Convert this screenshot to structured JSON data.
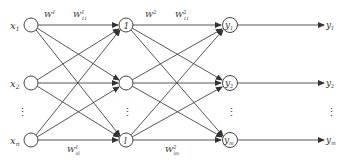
{
  "diagram": {
    "type": "feedforward-neural-network",
    "layers": {
      "input": {
        "nodes": [
          {
            "id": "x1",
            "label": "x",
            "sub": "1"
          },
          {
            "id": "x2",
            "label": "x",
            "sub": "2"
          },
          {
            "id": "xn",
            "label": "x",
            "sub": "n"
          }
        ],
        "ellipsis": "⋮"
      },
      "hidden": {
        "nodes": [
          {
            "id": "h1",
            "label": "1"
          },
          {
            "id": "h2",
            "label": ""
          },
          {
            "id": "hl",
            "label": "l"
          }
        ],
        "ellipsis": "⋮"
      },
      "output": {
        "nodes": [
          {
            "id": "y1",
            "label": "y",
            "sub": "1"
          },
          {
            "id": "y2",
            "label": "y",
            "sub": "2"
          },
          {
            "id": "ym",
            "label": "y",
            "sub": "m"
          }
        ],
        "ellipsis": "⋮"
      },
      "outputs": {
        "labels": [
          {
            "label": "y",
            "sub": "1"
          },
          {
            "label": "y",
            "sub": "2"
          },
          {
            "label": "y",
            "sub": "m"
          }
        ],
        "ellipsis": "⋮"
      }
    },
    "weight_labels": {
      "w1": {
        "base": "W",
        "sup": "1"
      },
      "w1_11": {
        "base": "W",
        "sup": "1",
        "sub": "11"
      },
      "w2": {
        "base": "W",
        "sup": "2"
      },
      "w2_11": {
        "base": "W",
        "sup": "2",
        "sub": "11"
      },
      "w1_nl": {
        "base": "W",
        "sup": "1",
        "sub": "nl"
      },
      "w2_lm": {
        "base": "W",
        "sup": "2",
        "sub": "lm"
      }
    }
  }
}
